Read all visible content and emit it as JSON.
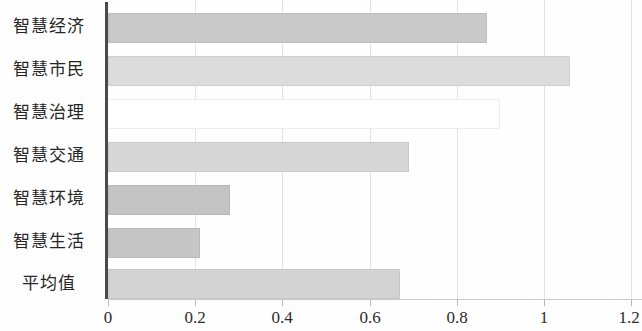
{
  "chart_data": {
    "type": "bar",
    "orientation": "horizontal",
    "title": "",
    "subtitle": "",
    "xlabel": "",
    "ylabel": "",
    "categories": [
      "智慧经济",
      "智慧市民",
      "智慧治理",
      "智慧交通",
      "智慧环境",
      "智慧生活",
      "平均值"
    ],
    "values": [
      0.87,
      1.06,
      0.9,
      0.69,
      0.28,
      0.21,
      0.67
    ],
    "xlim": [
      0,
      1.2
    ],
    "xticks": [
      0,
      0.2,
      0.4,
      0.6,
      0.8,
      1,
      1.2
    ],
    "xtick_labels": [
      "0",
      "0.2",
      "0.4",
      "0.6",
      "0.8",
      "1",
      "1.2"
    ],
    "grid": true,
    "grid_axis": "x",
    "legend": null,
    "legend_position": "none",
    "bar_colors": [
      "#c9c9c9",
      "#dcdcdc",
      "#ffffff",
      "#d7d7d7",
      "#c4c4c4",
      "#c6c6c6",
      "#d3d3d3"
    ],
    "annotations": []
  },
  "axis": {
    "grid_color": "#e3e3e3",
    "axis_color": "#4a4a4a",
    "tick_color": "#b9b9b9"
  }
}
